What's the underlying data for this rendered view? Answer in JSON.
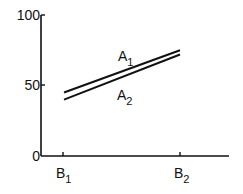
{
  "chart_data": {
    "type": "line",
    "title": "",
    "xlabel": "",
    "ylabel": "",
    "ylim": [
      0,
      100
    ],
    "yticks": [
      "0",
      "50",
      "100"
    ],
    "categories": [
      "B1",
      "B2"
    ],
    "x_tick_labels": [
      {
        "base": "B",
        "sub": "1"
      },
      {
        "base": "B",
        "sub": "2"
      }
    ],
    "series": [
      {
        "name": "A1",
        "label_base": "A",
        "label_sub": "1",
        "values": [
          45,
          75
        ]
      },
      {
        "name": "A2",
        "label_base": "A",
        "label_sub": "2",
        "values": [
          40,
          72
        ]
      }
    ],
    "grid": false,
    "legend": "inline labels"
  }
}
